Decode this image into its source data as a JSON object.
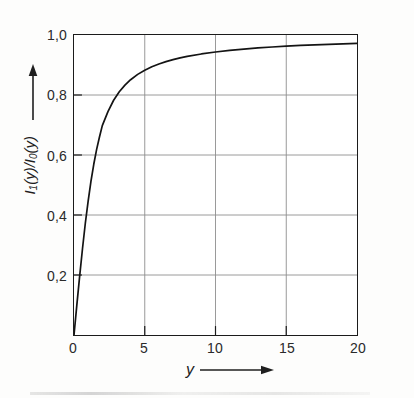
{
  "figure": {
    "background_color": "#fdfdfc",
    "frame_color": "#1b1b1b",
    "grid_color": "#8d8d8d",
    "curve_color": "#141414"
  },
  "axes": {
    "y": {
      "caption_main": "I",
      "caption_text": "I₁(y)/I₀(y)",
      "arrow_icon": "up-arrow-icon",
      "ticks": [
        "0,2",
        "0,4",
        "0,6",
        "0,8",
        "1,0"
      ],
      "tick_values": [
        0.2,
        0.4,
        0.6,
        0.8,
        1.0
      ],
      "range": [
        0,
        1
      ]
    },
    "x": {
      "caption_text": "y",
      "arrow_icon": "right-arrow-icon",
      "ticks": [
        "0",
        "5",
        "10",
        "15",
        "20"
      ],
      "tick_values": [
        0,
        5,
        10,
        15,
        20
      ],
      "range": [
        0,
        20
      ]
    }
  },
  "chart_data": {
    "type": "line",
    "title": "",
    "subtitle": "",
    "xlabel": "y",
    "ylabel": "I₁(y)/I₀(y)",
    "xlim": [
      0,
      20
    ],
    "ylim": [
      0,
      1
    ],
    "grid": true,
    "legend": null,
    "xticks": [
      0,
      5,
      10,
      15,
      20
    ],
    "xticklabels": [
      "0",
      "5",
      "10",
      "15",
      "20"
    ],
    "yticks": [
      0.2,
      0.4,
      0.6,
      0.8,
      1.0
    ],
    "yticklabels": [
      "0,2",
      "0,4",
      "0,6",
      "0,8",
      "1,0"
    ],
    "series": [
      {
        "name": "I1(y)/I0(y)",
        "color": "#141414",
        "linewidth": 1.7,
        "x": [
          0,
          0.2,
          0.4,
          0.6,
          0.8,
          1.0,
          1.2,
          1.4,
          1.6,
          1.8,
          2.0,
          2.4,
          2.8,
          3.2,
          3.6,
          4.0,
          4.5,
          5.0,
          5.5,
          6.0,
          6.5,
          7.0,
          7.5,
          8.0,
          9.0,
          10.0,
          11.0,
          12.0,
          13.0,
          14.0,
          15.0,
          16.0,
          17.0,
          18.0,
          19.0,
          20.0
        ],
        "y": [
          0.0,
          0.0995,
          0.196,
          0.2875,
          0.3725,
          0.4464,
          0.5126,
          0.5699,
          0.6187,
          0.66,
          0.6978,
          0.7448,
          0.7825,
          0.8106,
          0.833,
          0.8509,
          0.8687,
          0.8827,
          0.894,
          0.9033,
          0.9111,
          0.9178,
          0.9235,
          0.9285,
          0.9368,
          0.9434,
          0.9487,
          0.9531,
          0.9568,
          0.96,
          0.9627,
          0.9651,
          0.9672,
          0.969,
          0.9707,
          0.9722
        ]
      }
    ],
    "annotations": [
      {
        "name": "y-axis-arrow",
        "text": "↑"
      },
      {
        "name": "x-axis-arrow",
        "text": "→"
      }
    ]
  }
}
